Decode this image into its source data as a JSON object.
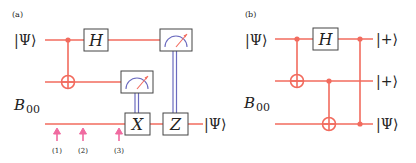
{
  "colors": {
    "wire": "#f26b5e",
    "classical": "#6b6bbf",
    "box_border": "#444444",
    "arrow": "#f06aa0",
    "text": "#222222"
  },
  "panel_a": {
    "tag": "(a)",
    "input_top": "|Ψ⟩",
    "input_bell": "B",
    "input_bell_sub": "00",
    "gate_h": "H",
    "gate_x": "X",
    "gate_z": "Z",
    "output": "|Ψ⟩",
    "steps": [
      "(1)",
      "(2)",
      "(3)"
    ]
  },
  "panel_b": {
    "tag": "(b)",
    "input_top": "|Ψ⟩",
    "input_bell": "B",
    "input_bell_sub": "00",
    "gate_h": "H",
    "outputs": [
      "|+⟩",
      "|+⟩",
      "|Ψ⟩"
    ]
  }
}
